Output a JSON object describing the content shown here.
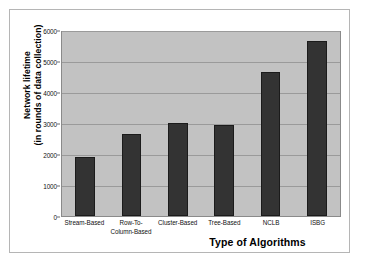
{
  "chart_data": {
    "type": "bar",
    "title": "",
    "xlabel": "Type of Algorithms",
    "ylabel": "Network lifetime (in rounds of data collection)",
    "ylabel_lines": [
      "Network lifetime",
      "(in rounds of data collection)"
    ],
    "categories": [
      "Stream-Based",
      "Row-To-Column-Based",
      "Cluster-Based",
      "Tree-Based",
      "NCLB",
      "ISBG"
    ],
    "category_lines": [
      [
        "Stream-Based"
      ],
      [
        "Row-To-",
        "Column-Based"
      ],
      [
        "Cluster-Based"
      ],
      [
        "Tree-Based"
      ],
      [
        "NCLB"
      ],
      [
        "ISBG"
      ]
    ],
    "values": [
      1900,
      2630,
      3010,
      2940,
      4650,
      5650
    ],
    "ylim": [
      0,
      6000
    ],
    "yticks": [
      0,
      1000,
      2000,
      3000,
      4000,
      5000,
      6000
    ],
    "ytick_labels": [
      "0",
      "1000",
      "2000",
      "3000",
      "4000",
      "5000",
      "6000"
    ],
    "grid": true,
    "legend": false,
    "colors": {
      "bar": "#333333",
      "bar_edge": "#1b1b1b",
      "plot_background": "#c2c2c2",
      "gridline": "#9a9a9a",
      "axis": "#8a8a8a",
      "text": "#000000",
      "card_background": "#ffffff",
      "card_border": "#b5b5b5"
    }
  }
}
